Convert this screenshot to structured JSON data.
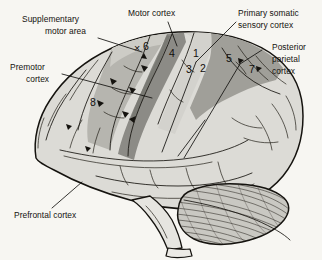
{
  "figure": {
    "kind": "anatomical-illustration",
    "background_color": "#f7f6f2",
    "ink_color": "#15130f"
  },
  "labels": {
    "supplementary_motor_area": {
      "line1": "Supplementary",
      "line2": "motor area"
    },
    "premotor_cortex": {
      "line1": "Premotor",
      "line2": "cortex"
    },
    "motor_cortex": {
      "line1": "Motor cortex"
    },
    "primary_somatic_sensory_cortex": {
      "line1": "Primary somatic",
      "line2": "sensory cortex"
    },
    "posterior_parietal_cortex": {
      "line1": "Posterior",
      "line2": "parietal",
      "line3": "cortex"
    },
    "prefrontal_cortex": {
      "line1": "Prefrontal cortex"
    }
  },
  "brodmann_areas": [
    {
      "id": "area-8",
      "number": "8",
      "x": 93,
      "y": 106,
      "region": "premotor / frontal eye field"
    },
    {
      "id": "area-6",
      "number": "6",
      "x": 146,
      "y": 50,
      "region": "premotor cortex"
    },
    {
      "id": "area-4",
      "number": "4",
      "x": 172,
      "y": 57,
      "region": "primary motor cortex"
    },
    {
      "id": "area-1",
      "number": "1",
      "x": 196,
      "y": 57,
      "region": "primary somatic sensory cortex"
    },
    {
      "id": "area-3",
      "number": "3",
      "x": 189,
      "y": 73,
      "region": "primary somatic sensory cortex"
    },
    {
      "id": "area-2",
      "number": "2",
      "x": 203,
      "y": 72,
      "region": "primary somatic sensory cortex"
    },
    {
      "id": "area-5",
      "number": "5",
      "x": 229,
      "y": 62,
      "region": "posterior parietal cortex"
    },
    {
      "id": "area-7",
      "number": "7",
      "x": 252,
      "y": 73,
      "region": "posterior parietal cortex"
    }
  ],
  "shading": {
    "cortex_base": "#dcdbd6",
    "premotor_mid": "#b9b8b2",
    "supplementary_light": "#cbcac4",
    "motor_dark": "#8e8d88",
    "somatosensory_light": "#d5d4cf",
    "parietal_dark": "#a2a19b",
    "cerebellum": "#c9c8c2",
    "brainstem": "#e4e3de"
  },
  "marks": {
    "sma_cross": "×"
  }
}
